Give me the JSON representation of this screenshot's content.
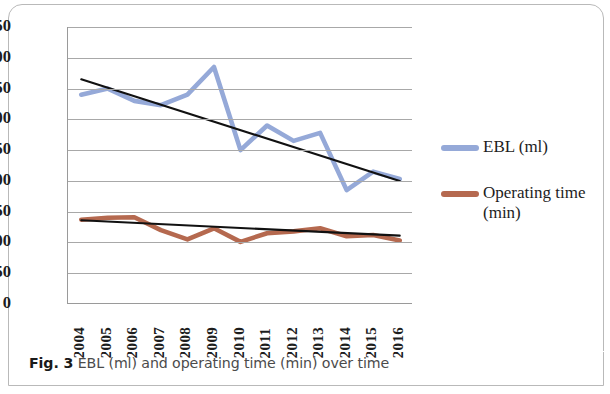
{
  "figure": {
    "caption_label": "Fig. 3",
    "caption_text": "EBL (ml) and operating time (min) over time"
  },
  "legend": {
    "position": "right",
    "entries": [
      {
        "label": "EBL (ml)",
        "color": "#95a9d8",
        "swatch_name": "legend-swatch-ebl"
      },
      {
        "label": "Operating time (min)",
        "color": "#b5694f",
        "swatch_name": "legend-swatch-operating-time"
      }
    ]
  },
  "chart_data": {
    "type": "line",
    "title": "",
    "xlabel": "",
    "ylabel": "",
    "grid": true,
    "legend_position": "right",
    "categories": [
      "2004",
      "2005",
      "2006",
      "2007",
      "2008",
      "2009",
      "2010",
      "2011",
      "2012",
      "2013",
      "2014",
      "2015",
      "2016"
    ],
    "ylim": [
      0,
      450
    ],
    "yticks": [
      0,
      50,
      100,
      150,
      200,
      250,
      300,
      350,
      400,
      450
    ],
    "series": [
      {
        "name": "EBL (ml)",
        "color": "#95a9d8",
        "values": [
          340,
          350,
          330,
          323,
          340,
          385,
          250,
          290,
          265,
          278,
          185,
          215,
          203
        ]
      },
      {
        "name": "Operating time (min)",
        "color": "#b5694f",
        "values": [
          137,
          140,
          141,
          120,
          105,
          123,
          101,
          115,
          118,
          123,
          110,
          112,
          103
        ]
      },
      {
        "name": "EBL trendline",
        "color": "#111111",
        "trend": true,
        "values": [
          365,
          351,
          338,
          324,
          310,
          296,
          283,
          269,
          255,
          241,
          228,
          214,
          200
        ]
      },
      {
        "name": "Operating time trendline",
        "color": "#111111",
        "trend": true,
        "values": [
          136,
          134,
          132,
          130,
          128,
          126,
          123,
          121,
          119,
          117,
          115,
          113,
          111
        ]
      }
    ]
  }
}
